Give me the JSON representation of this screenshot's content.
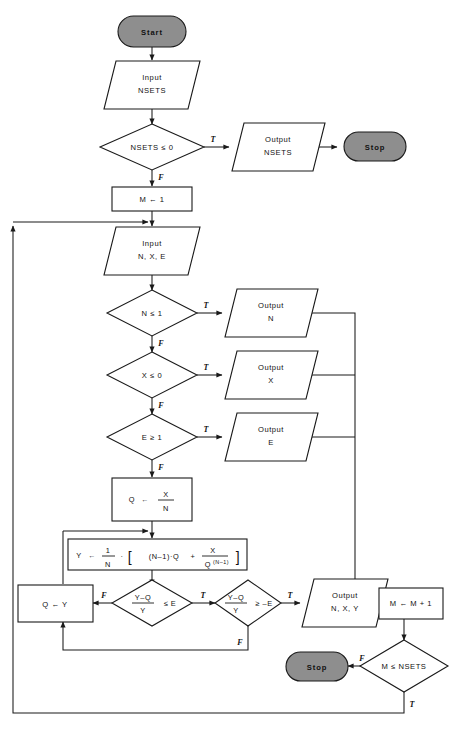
{
  "diagram": {
    "colors": {
      "terminal_fill": "#8e8e8e",
      "stroke": "#1a1a1a",
      "shape_fill": "#ffffff"
    },
    "flags": {
      "true": "T",
      "false": "F"
    }
  },
  "nodes": {
    "start": {
      "label": "Start",
      "type": "terminal"
    },
    "input_nsets": {
      "line1": "Input",
      "line2": "NSETS",
      "type": "io"
    },
    "dec_nsets": {
      "label": "NSETS ≤ 0",
      "type": "decision"
    },
    "out_nsets": {
      "line1": "Output",
      "line2": "NSETS",
      "type": "io"
    },
    "stop_top": {
      "label": "Stop",
      "type": "terminal"
    },
    "m_init": {
      "label": "M ← 1",
      "type": "process"
    },
    "input_nxe": {
      "line1": "Input",
      "line2": "N, X, E",
      "type": "io"
    },
    "dec_n": {
      "label": "N ≤ 1",
      "type": "decision"
    },
    "out_n": {
      "line1": "Output",
      "line2": "N",
      "type": "io"
    },
    "dec_x": {
      "label": "X ≤ 0",
      "type": "decision"
    },
    "out_x": {
      "line1": "Output",
      "line2": "X",
      "type": "io"
    },
    "dec_e": {
      "label": "E ≥ 1",
      "type": "decision"
    },
    "out_e": {
      "line1": "Output",
      "line2": "E",
      "type": "io"
    },
    "q_init": {
      "lhs": "Q",
      "arrow": "←",
      "num": "X",
      "den": "N",
      "type": "process"
    },
    "y_calc": {
      "lhs": "Y",
      "arrow": "←",
      "formula": "1/N · [(N–1)·Q + X/Q^(N–1)]",
      "one": "1",
      "n": "N",
      "dot": "·",
      "bracket_open": "[",
      "bracket_close": "]",
      "term1": "(N–1)·Q",
      "plus": "+",
      "frac_num": "X",
      "frac_den_base": "Q",
      "frac_den_exp": "(N–1)",
      "type": "process"
    },
    "dec_le": {
      "num": "Y–Q",
      "den": "Y",
      "cmp": "≤ E",
      "type": "decision"
    },
    "dec_ge": {
      "num": "Y–Q",
      "den": "Y",
      "cmp": "≥ –E",
      "type": "decision"
    },
    "q_assign": {
      "label": "Q ← Y",
      "type": "process"
    },
    "out_nxy": {
      "line1": "Output",
      "line2": "N, X, Y",
      "type": "io"
    },
    "m_incr": {
      "label": "M ← M + 1",
      "type": "process"
    },
    "dec_msets": {
      "label": "M ≤ NSETS",
      "type": "decision"
    },
    "stop_bottom": {
      "label": "Stop",
      "type": "terminal"
    }
  }
}
